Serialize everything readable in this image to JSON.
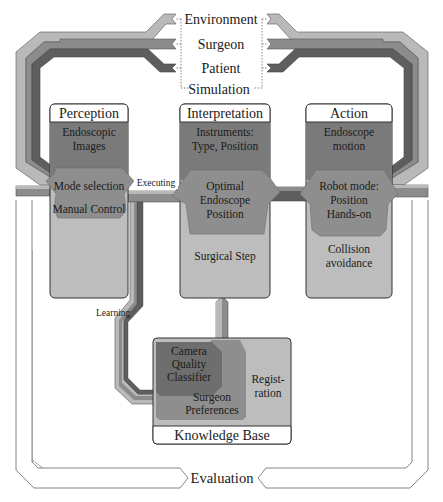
{
  "colors": {
    "band_light": "#b9b9b9",
    "band_mid": "#8c8c8c",
    "band_dark": "#5e5e5e",
    "box_top": "#7a7a7a",
    "box_middle": "#8e8e8e",
    "box_bottom": "#bdbdbd",
    "header_bg": "#ffffff",
    "outline": "#333333"
  },
  "sources": {
    "items": [
      "Environment",
      "Surgeon",
      "Patient",
      "Simulation"
    ]
  },
  "perception": {
    "title": "Perception",
    "top_line1": "Endoscopic",
    "top_line2": "Images",
    "middle_line1": "Mode selection",
    "middle_line2": "Manual Control"
  },
  "interpretation": {
    "title": "Interpretation",
    "top_line1": "Instruments:",
    "top_line2": "Type, Position",
    "middle_line1": "Optimal",
    "middle_line2": "Endoscope",
    "middle_line3": "Position",
    "bottom": "Surgical Step"
  },
  "action": {
    "title": "Action",
    "top_line1": "Endoscope",
    "top_line2": "motion",
    "middle_line1": "Robot mode:",
    "middle_line2": "Position",
    "middle_line3": "Hands-on",
    "bottom_line1": "Collision",
    "bottom_line2": "avoidance"
  },
  "knowledge_base": {
    "title": "Knowledge Base",
    "classifier_line1": "Camera",
    "classifier_line2": "Quality",
    "classifier_line3": "Classifier",
    "preferences_line1": "Surgeon",
    "preferences_line2": "Preferences",
    "registration_line1": "Regist-",
    "registration_line2": "ration"
  },
  "labels": {
    "executing": "Executing",
    "learning": "Learning",
    "evaluation": "Evaluation"
  }
}
